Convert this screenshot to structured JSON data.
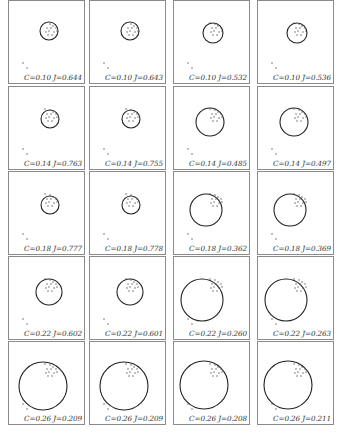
{
  "figure": {
    "layout": {
      "rows": 5,
      "cols": 4
    },
    "colors": {
      "border": "#8a8a8a",
      "circle": "#222222",
      "point": "#555555",
      "text": "#333333"
    },
    "panels": [
      {
        "row": 0,
        "col": 0,
        "label": "C=0.10 J=0.644",
        "circle": {
          "cx": 40,
          "cy": 30,
          "r": 9
        }
      },
      {
        "row": 0,
        "col": 1,
        "label": "C=0.10 J=0.643",
        "circle": {
          "cx": 40,
          "cy": 30,
          "r": 9
        }
      },
      {
        "row": 0,
        "col": 2,
        "label": "C=0.10 J=0.532",
        "circle": {
          "cx": 39,
          "cy": 32,
          "r": 10
        }
      },
      {
        "row": 0,
        "col": 3,
        "label": "C=0.10 J=0.536",
        "circle": {
          "cx": 39,
          "cy": 32,
          "r": 10
        }
      },
      {
        "row": 1,
        "col": 0,
        "label": "C=0.14 J=0.763",
        "circle": {
          "cx": 41,
          "cy": 32,
          "r": 9
        }
      },
      {
        "row": 1,
        "col": 1,
        "label": "C=0.14 J=0.755",
        "circle": {
          "cx": 41,
          "cy": 32,
          "r": 9
        }
      },
      {
        "row": 1,
        "col": 2,
        "label": "C=0.14 J=0.485",
        "circle": {
          "cx": 36,
          "cy": 35,
          "r": 14
        }
      },
      {
        "row": 1,
        "col": 3,
        "label": "C=0.14 J=0.497",
        "circle": {
          "cx": 36,
          "cy": 35,
          "r": 14
        }
      },
      {
        "row": 2,
        "col": 0,
        "label": "C=0.18 J=0.777",
        "circle": {
          "cx": 41,
          "cy": 33,
          "r": 9
        }
      },
      {
        "row": 2,
        "col": 1,
        "label": "C=0.18 J=0.778",
        "circle": {
          "cx": 41,
          "cy": 33,
          "r": 9
        }
      },
      {
        "row": 2,
        "col": 2,
        "label": "C=0.18 J=0.362",
        "circle": {
          "cx": 32,
          "cy": 38,
          "r": 16
        }
      },
      {
        "row": 2,
        "col": 3,
        "label": "C=0.18 J=0.369",
        "circle": {
          "cx": 32,
          "cy": 38,
          "r": 16
        }
      },
      {
        "row": 3,
        "col": 0,
        "label": "C=0.22 J=0.602",
        "circle": {
          "cx": 40,
          "cy": 35,
          "r": 13
        }
      },
      {
        "row": 3,
        "col": 1,
        "label": "C=0.22 J=0.601",
        "circle": {
          "cx": 40,
          "cy": 35,
          "r": 13
        }
      },
      {
        "row": 3,
        "col": 2,
        "label": "C=0.22 J=0.260",
        "circle": {
          "cx": 28,
          "cy": 43,
          "r": 21
        }
      },
      {
        "row": 3,
        "col": 3,
        "label": "C=0.22 J=0.263",
        "circle": {
          "cx": 28,
          "cy": 43,
          "r": 21
        }
      },
      {
        "row": 4,
        "col": 0,
        "label": "C=0.26 J=0.209",
        "circle": {
          "cx": 34,
          "cy": 44,
          "r": 24
        }
      },
      {
        "row": 4,
        "col": 1,
        "label": "C=0.26 J=0.209",
        "circle": {
          "cx": 34,
          "cy": 44,
          "r": 24
        }
      },
      {
        "row": 4,
        "col": 2,
        "label": "C=0.26 J=0.208",
        "circle": {
          "cx": 30,
          "cy": 43,
          "r": 24
        }
      },
      {
        "row": 4,
        "col": 3,
        "label": "C=0.26 J=0.211",
        "circle": {
          "cx": 30,
          "cy": 43,
          "r": 24
        }
      }
    ],
    "cluster_points": [
      [
        36,
        22
      ],
      [
        41,
        23
      ],
      [
        44,
        25
      ],
      [
        38,
        27
      ],
      [
        42,
        27
      ],
      [
        47,
        27
      ],
      [
        37,
        31
      ],
      [
        40,
        30
      ],
      [
        45,
        31
      ],
      [
        43,
        34
      ],
      [
        48,
        30
      ],
      [
        39,
        34
      ]
    ],
    "outlier_points": [
      [
        14,
        62
      ],
      [
        18,
        67
      ]
    ]
  }
}
